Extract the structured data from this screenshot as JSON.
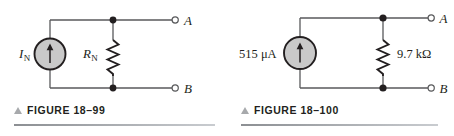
{
  "figures": [
    {
      "id": "figure-18-99",
      "caption": "FIGURE 18–99",
      "caption_marker": "triangle-up-icon",
      "source": {
        "label": "I₅",
        "label_main": "I",
        "label_sub": "N",
        "type": "current-source",
        "arrow_direction": "up",
        "fill_color": "#c9c9c9",
        "stroke_color": "#231f20"
      },
      "resistor": {
        "label_main": "R",
        "label_sub": "N",
        "type": "zigzag-resistor"
      },
      "terminals": [
        {
          "label": "A",
          "position": "top-right"
        },
        {
          "label": "B",
          "position": "bottom-right"
        }
      ]
    },
    {
      "id": "figure-18-100",
      "caption": "FIGURE 18–100",
      "caption_marker": "triangle-up-icon",
      "source": {
        "label": "515 μA",
        "value": "515",
        "unit": "μA",
        "type": "current-source",
        "arrow_direction": "up",
        "fill_color": "#c9c9c9",
        "stroke_color": "#231f20"
      },
      "resistor": {
        "label": "9.7 kΩ",
        "value": "9.7",
        "unit": "kΩ",
        "type": "zigzag-resistor"
      },
      "terminals": [
        {
          "label": "A",
          "position": "top-right"
        },
        {
          "label": "B",
          "position": "bottom-right"
        }
      ]
    }
  ],
  "colors": {
    "wire": "#58595b",
    "node": "#231f20",
    "text": "#231f20",
    "caption_marker": "#a7a9ac",
    "rule": "#8c8f93",
    "source_fill": "#c9c9c9"
  }
}
